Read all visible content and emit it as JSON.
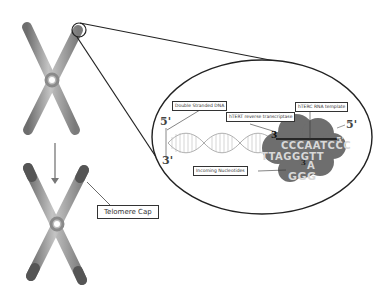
{
  "diagram": {
    "labels": {
      "double_stranded_dna": "Double Stranded DNA",
      "hert_reverse_transcriptase": "hTERT reverse transcriptase",
      "hterc_rna_template": "hTERC RNA template",
      "incoming_nucleotides": "Incoming Nucleotides",
      "telomere_cap": "Telomere Cap"
    },
    "strand_ends": {
      "dna_top_left": "5'",
      "dna_bottom_left": "3'",
      "template_3_prime": "3",
      "template_right_top": "5'",
      "template_right_end": "5'",
      "nucleotide_3": "3"
    },
    "sequences": {
      "rna_template": "CCCAATCCC",
      "synthesized_strand": "TTAGGGTT",
      "incoming_a": "A",
      "incoming_ggg": "GGG"
    },
    "colors": {
      "chromosome": "#9a9a9a",
      "chromosome_cap": "#555555",
      "enzyme_cloud": "#6e6e6e",
      "outline": "#222222",
      "base_letters": "#d8d8d8"
    }
  }
}
